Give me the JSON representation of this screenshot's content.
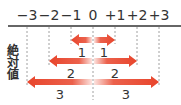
{
  "title_vertical": "絶対値",
  "ticks": [
    {
      "label": "−3",
      "value": -3,
      "x": 27
    },
    {
      "label": "−2",
      "value": -2,
      "x": 49
    },
    {
      "label": "−1",
      "value": -1,
      "x": 71
    },
    {
      "label": "0",
      "value": 0,
      "x": 93
    },
    {
      "label": "+1",
      "value": 1,
      "x": 115
    },
    {
      "label": "+2",
      "value": 2,
      "x": 137
    },
    {
      "label": "+3",
      "value": 3,
      "x": 159
    }
  ],
  "rows": [
    {
      "abs": 1,
      "left_label": "1",
      "right_label": "1",
      "y": 40,
      "label_y": 46
    },
    {
      "abs": 2,
      "left_label": "2",
      "right_label": "2",
      "y": 61,
      "label_y": 67
    },
    {
      "abs": 3,
      "left_label": "3",
      "right_label": "3",
      "y": 82,
      "label_y": 88
    }
  ],
  "colors": {
    "arrow": "#e8452c",
    "axis": "#333333",
    "guide": "#888888"
  }
}
